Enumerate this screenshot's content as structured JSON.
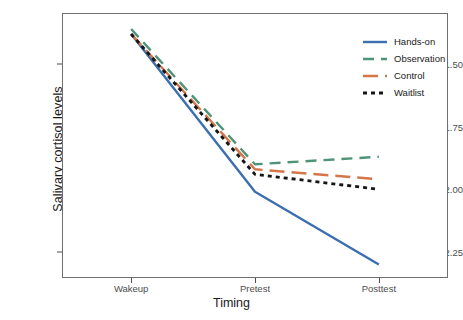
{
  "chart_data": {
    "type": "line",
    "title": "",
    "xlabel": "Timing",
    "ylabel": "Salivary cortisol levels",
    "categories": [
      "Wakeup",
      "Pretest",
      "Posttest"
    ],
    "x": [
      0,
      1,
      2
    ],
    "ylim": [
      -2.35,
      -1.3
    ],
    "xlim": [
      -0.55,
      2.55
    ],
    "yticks": [
      -1.5,
      -1.75,
      -2.0,
      -2.25
    ],
    "ytick_labels": [
      "-1.50",
      "-1.75",
      "-2.00",
      "-2.25"
    ],
    "xtick_labels": [
      "Wakeup",
      "Pretest",
      "Posttest"
    ],
    "grid": false,
    "legend_position": "top-right-inside",
    "series": [
      {
        "name": "Hands-on",
        "values": [
          -1.38,
          -2.01,
          -2.3
        ],
        "color": "#3b6fb0",
        "linestyle": "solid",
        "dasharray": "",
        "linewidth": 2.4
      },
      {
        "name": "Observation",
        "values": [
          -1.36,
          -1.9,
          -1.87
        ],
        "color": "#4f9478",
        "linestyle": "dashed",
        "dasharray": "11,7",
        "linewidth": 2.4
      },
      {
        "name": "Control",
        "values": [
          -1.38,
          -1.92,
          -1.96
        ],
        "color": "#d4764a",
        "linestyle": "long-dash",
        "dasharray": "15,7",
        "linewidth": 2.4
      },
      {
        "name": "Waitlist",
        "values": [
          -1.38,
          -1.94,
          -2.0
        ],
        "color": "#161616",
        "linestyle": "dotted",
        "dasharray": "4,4",
        "linewidth": 2.8
      }
    ]
  },
  "axes": {
    "y_title": "Salivary cortisol levels",
    "x_title": "Timing",
    "y_ticks": [
      {
        "label": "-1.50"
      },
      {
        "label": "-1.75"
      },
      {
        "label": "-2.00"
      },
      {
        "label": "-2.25"
      }
    ],
    "x_ticks": [
      {
        "label": "Wakeup"
      },
      {
        "label": "Pretest"
      },
      {
        "label": "Posttest"
      }
    ]
  },
  "legend": {
    "items": [
      {
        "label": "Hands-on"
      },
      {
        "label": "Observation"
      },
      {
        "label": "Control"
      },
      {
        "label": "Waitlist"
      }
    ]
  },
  "colors": {
    "hands_on": "#3b6fb0",
    "observation": "#4f9478",
    "control": "#d4764a",
    "waitlist": "#161616",
    "panel_border": "#6e6e6e",
    "tick_text": "#4d4d4d",
    "title_text": "#1a1a1a",
    "background": "#ffffff"
  }
}
